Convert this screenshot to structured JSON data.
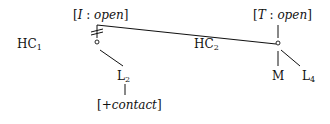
{
  "nodes": {
    "hc1": {
      "label": "HC",
      "sub": "1"
    },
    "hc2": {
      "label": "HC",
      "sub": "2"
    },
    "left_feature": {
      "open_bracket": "[",
      "letter": "I",
      "colon": " : ",
      "value": "open",
      "close_bracket": "]"
    },
    "right_feature": {
      "open_bracket": "[",
      "letter": "T",
      "colon": " : ",
      "value": "open",
      "close_bracket": "]"
    },
    "l2": {
      "label": "L",
      "sub": "2"
    },
    "l4": {
      "label": "L",
      "sub": "4"
    },
    "m": {
      "label": "M"
    },
    "contact": {
      "open_bracket": "[",
      "value": "+contact",
      "close_bracket": "]"
    }
  }
}
